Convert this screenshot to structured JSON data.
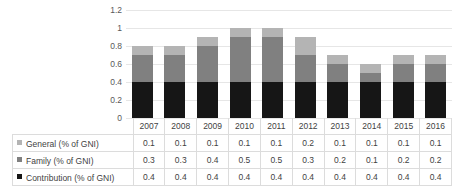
{
  "chart_data": {
    "type": "bar",
    "subtype": "stacked-column-with-data-table",
    "title": "",
    "xlabel": "",
    "ylabel": "",
    "ylim": [
      0,
      1.2
    ],
    "yticks": [
      "0",
      "0.2",
      "0.4",
      "0.6",
      "0.8",
      "1",
      "1.2"
    ],
    "ytick_values": [
      0,
      0.2,
      0.4,
      0.6,
      0.8,
      1,
      1.2
    ],
    "grid": true,
    "legend_position": "data-table-row-headers",
    "stack_order_bottom_to_top": [
      "Contribution (% of GNI)",
      "Family (% of GNI)",
      "General (% of GNI)"
    ],
    "categories": [
      "2007",
      "2008",
      "2009",
      "2010",
      "2011",
      "2012",
      "2013",
      "2014",
      "2015",
      "2016"
    ],
    "series": [
      {
        "name": "General (% of GNI)",
        "color": "#b4b4b4",
        "values": [
          0.1,
          0.1,
          0.1,
          0.1,
          0.1,
          0.2,
          0.1,
          0.1,
          0.1,
          0.1
        ]
      },
      {
        "name": "Family (% of GNI)",
        "color": "#808080",
        "values": [
          0.3,
          0.3,
          0.4,
          0.5,
          0.5,
          0.3,
          0.2,
          0.1,
          0.2,
          0.2
        ]
      },
      {
        "name": "Contribution (% of GNI)",
        "color": "#161616",
        "values": [
          0.4,
          0.4,
          0.4,
          0.4,
          0.4,
          0.4,
          0.4,
          0.4,
          0.4,
          0.4
        ]
      }
    ],
    "totals": [
      0.8,
      0.8,
      0.9,
      1.0,
      1.0,
      0.9,
      0.7,
      0.6,
      0.7,
      0.7
    ]
  },
  "table": {
    "row_labels": [
      "General (% of GNI)",
      "Family (% of GNI)",
      "Contribution (% of GNI)"
    ],
    "columns": [
      "2007",
      "2008",
      "2009",
      "2010",
      "2011",
      "2012",
      "2013",
      "2014",
      "2015",
      "2016"
    ],
    "rows": [
      [
        "0.1",
        "0.1",
        "0.1",
        "0.1",
        "0.1",
        "0.2",
        "0.1",
        "0.1",
        "0.1",
        "0.1"
      ],
      [
        "0.3",
        "0.3",
        "0.4",
        "0.5",
        "0.5",
        "0.3",
        "0.2",
        "0.1",
        "0.2",
        "0.2"
      ],
      [
        "0.4",
        "0.4",
        "0.4",
        "0.4",
        "0.4",
        "0.4",
        "0.4",
        "0.4",
        "0.4",
        "0.4"
      ]
    ]
  },
  "colors": {
    "general": "#b4b4b4",
    "family": "#808080",
    "contribution": "#161616",
    "gridline": "#e6e6e6",
    "table_border": "#dcdcdc",
    "text": "#3f3f3f",
    "background": "#ffffff"
  }
}
